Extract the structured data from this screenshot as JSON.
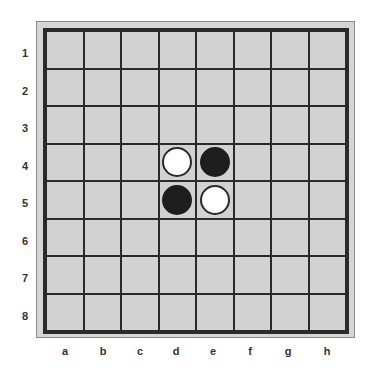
{
  "board": {
    "rows": [
      "1",
      "2",
      "3",
      "4",
      "5",
      "6",
      "7",
      "8"
    ],
    "columns": [
      "a",
      "b",
      "c",
      "d",
      "e",
      "f",
      "g",
      "h"
    ],
    "pieces": [
      {
        "square": "d4",
        "row": 3,
        "col": 3,
        "color": "white"
      },
      {
        "square": "e4",
        "row": 3,
        "col": 4,
        "color": "black"
      },
      {
        "square": "d5",
        "row": 4,
        "col": 3,
        "color": "black"
      },
      {
        "square": "e5",
        "row": 4,
        "col": 4,
        "color": "white"
      }
    ],
    "colors": {
      "cell": "#d2d2d2",
      "grid_line": "#2a2a2a",
      "white_piece": "#ffffff",
      "black_piece": "#1e1e1e",
      "margin": "#d6d6d6"
    }
  }
}
